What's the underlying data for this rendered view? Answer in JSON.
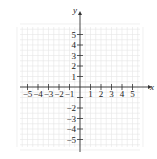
{
  "chart_data": {
    "type": "scatter",
    "title": "",
    "xlabel": "x",
    "ylabel": "y",
    "xlim": [
      -6,
      6
    ],
    "ylim": [
      -6,
      6
    ],
    "grid": true,
    "x_ticks": [
      -5,
      -4,
      -3,
      -2,
      -1,
      1,
      2,
      3,
      4,
      5
    ],
    "y_ticks": [
      5,
      4,
      3,
      2,
      1,
      -2,
      -3,
      -4,
      -5
    ],
    "x_tick_labels": [
      "−5",
      "−4",
      "−3",
      "−2",
      "−1",
      "1",
      "2",
      "3",
      "4",
      "5"
    ],
    "y_tick_labels": [
      "5",
      "4",
      "3",
      "2",
      "1",
      "−2",
      "−3",
      "−4",
      "−5"
    ],
    "series": [],
    "legend": null
  },
  "colors": {
    "axis": "#333333",
    "grid": "#e6e6e6",
    "text": "#222222"
  }
}
